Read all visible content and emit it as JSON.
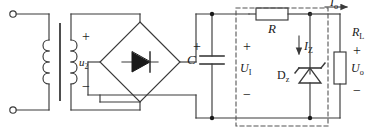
{
  "diagram": {
    "type": "schematic",
    "line_color": "#3a3a3a",
    "dash_color": "#555555",
    "text_color": "#1a1a1a"
  },
  "labels": {
    "secondary_voltage": "u",
    "secondary_voltage_sub": "2",
    "capacitor": "C",
    "series_resistor": "R",
    "input_voltage": "U",
    "input_voltage_sub": "I",
    "zener": "D",
    "zener_sub": "z",
    "zener_current": "I",
    "zener_current_sub": "Z",
    "output_current": "I",
    "output_current_sub": "o",
    "load_resistor": "R",
    "load_resistor_sub": "L",
    "output_voltage": "U",
    "output_voltage_sub": "o",
    "plus": "+",
    "minus": "−"
  },
  "components": [
    {
      "name": "ac-input-terminal-top",
      "kind": "terminal"
    },
    {
      "name": "ac-input-terminal-bottom",
      "kind": "terminal"
    },
    {
      "name": "transformer",
      "kind": "transformer",
      "primary_turns": 4,
      "secondary_turns": 4
    },
    {
      "name": "bridge-rectifier",
      "kind": "diode-bridge"
    },
    {
      "name": "filter-capacitor",
      "kind": "capacitor-polarized",
      "label": "C"
    },
    {
      "name": "series-resistor",
      "kind": "resistor",
      "label": "R"
    },
    {
      "name": "zener-diode",
      "kind": "zener",
      "label": "Dz"
    },
    {
      "name": "load-resistor",
      "kind": "resistor",
      "label": "RL"
    }
  ],
  "annotations": {
    "regulator_box": "dashed boundary enclosing R and Dz (voltage regulator stage)",
    "transformer_secondary_polarity": "+ on top, − on bottom",
    "capacitor_polarity": "+ on top",
    "load_polarity": "+ on top, − on bottom"
  }
}
